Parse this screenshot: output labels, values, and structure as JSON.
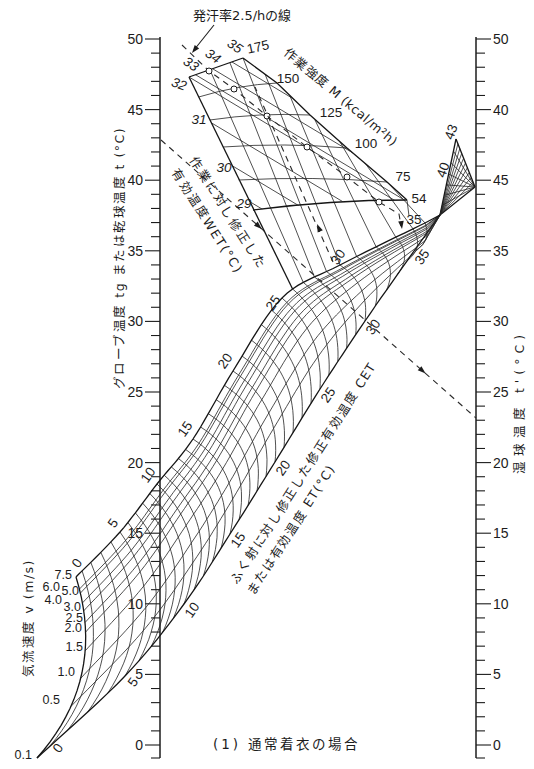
{
  "figure": {
    "caption": "(1) 通常着衣の場合"
  },
  "chart_data": {
    "type": "line",
    "subtype": "nomogram",
    "title": "(1) 通常着衣の場合",
    "left_axis": {
      "label": "グローブ温度 tg または乾球温度 t (°C)",
      "min": 0,
      "max": 50,
      "major_step": 5,
      "minor_step": 1,
      "tick_labels": [
        "50",
        "45",
        "40",
        "35",
        "30",
        "25",
        "20",
        "15",
        "10",
        "5",
        "0"
      ]
    },
    "right_axis": {
      "label": "湿球温度 t'(°C)",
      "min": 0,
      "max": 50,
      "major_step": 5,
      "minor_step": 1,
      "tick_labels": [
        "50",
        "40",
        "45",
        "35",
        "30",
        "25",
        "20",
        "15",
        "10",
        "5",
        "0"
      ]
    },
    "air_velocity_scale": {
      "label": "気流速度 v (m/s)",
      "values": [
        "0.1",
        "0.5",
        "1.0",
        "1.5",
        "2.0",
        "2.5",
        "3.0",
        "4.0",
        "5.0",
        "6.0",
        "7.5"
      ]
    },
    "effective_temperature_scale": {
      "label_line1": "ふく射に対し修正した修正有効温度 CET",
      "label_line2": "または有効温度 ET(°C)",
      "range": [
        0,
        35
      ],
      "grid_step": 1,
      "upper_edge_labels": [
        "0",
        "5",
        "10",
        "15",
        "20",
        "25",
        "30"
      ],
      "lower_edge_labels": [
        "0",
        "5",
        "10",
        "15",
        "20",
        "25",
        "30",
        "35"
      ]
    },
    "high_range_labels": [
      "40",
      "43"
    ],
    "work_intensity_scale": {
      "label": "作業強度 M (kcal/m²h)",
      "values": [
        "175",
        "150",
        "125",
        "100",
        "75",
        "54"
      ]
    },
    "wet_scale": {
      "label_line1": "作業に対し修正した",
      "label_line2": "有効温度WET(°C)",
      "values": [
        "35",
        "34",
        "33",
        "32",
        "31",
        "30",
        "29"
      ]
    },
    "sweat_rate_line": {
      "label": "発汗率2.5/hの線",
      "marked_at_M": [
        175,
        150,
        125,
        100,
        75,
        54
      ],
      "end_label": "35"
    },
    "example_reading": {
      "globe_temp_c": 43,
      "wet_bulb_temp_c": 23,
      "air_velocity_m_s": 0.1,
      "et_c": 30
    },
    "grid": false,
    "legend": "none"
  }
}
